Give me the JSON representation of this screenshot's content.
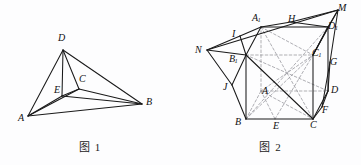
{
  "document": {
    "kind": "geometry-figure-pair",
    "background_color": "#fdfdfe",
    "ink_color": "#1a1a1a",
    "dashed_color": "#8d8d93"
  },
  "figure_1": {
    "caption": "图 1",
    "shape": "tetrahedron",
    "vertices": [
      {
        "id": "A",
        "label": "A",
        "x": 28,
        "y": 116,
        "label_x": 18,
        "label_y": 113
      },
      {
        "id": "B",
        "label": "B",
        "x": 142,
        "y": 104,
        "label_x": 146,
        "label_y": 97
      },
      {
        "id": "C",
        "label": "C",
        "x": 79,
        "y": 89,
        "label_x": 79,
        "label_y": 74
      },
      {
        "id": "D",
        "label": "D",
        "x": 63,
        "y": 50,
        "label_x": 58,
        "label_y": 33
      },
      {
        "id": "E",
        "label": "E",
        "x": 62,
        "y": 96,
        "label_x": 54,
        "label_y": 85
      }
    ],
    "solid_edges": [
      [
        "A",
        "B"
      ],
      [
        "A",
        "D"
      ],
      [
        "A",
        "C"
      ],
      [
        "A",
        "E"
      ],
      [
        "D",
        "B"
      ],
      [
        "D",
        "E"
      ],
      [
        "D",
        "C"
      ],
      [
        "C",
        "B"
      ],
      [
        "C",
        "E"
      ],
      [
        "E",
        "B"
      ]
    ],
    "dashed_edges": []
  },
  "figure_2": {
    "caption": "图 2",
    "shape": "cube-with-attached-prisms",
    "vertices": [
      {
        "id": "A1",
        "label": "A",
        "sub": "1",
        "x": 261,
        "y": 27,
        "label_x": 252,
        "label_y": 13
      },
      {
        "id": "B1",
        "label": "B",
        "sub": "1",
        "x": 246,
        "y": 55,
        "label_x": 229,
        "label_y": 54
      },
      {
        "id": "C1",
        "label": "C",
        "sub": "1",
        "x": 313,
        "y": 55,
        "label_x": 312,
        "label_y": 48
      },
      {
        "id": "D1",
        "label": "D",
        "sub": "1",
        "x": 328,
        "y": 27,
        "label_x": 328,
        "label_y": 21
      },
      {
        "id": "B",
        "label": "B",
        "x": 246,
        "y": 119,
        "label_x": 235,
        "label_y": 117
      },
      {
        "id": "C",
        "label": "C",
        "x": 313,
        "y": 119,
        "label_x": 310,
        "label_y": 120
      },
      {
        "id": "D",
        "label": "D",
        "x": 328,
        "y": 91,
        "label_x": 331,
        "label_y": 85
      },
      {
        "id": "A",
        "label": "A",
        "x": 261,
        "y": 91,
        "label_x": 262,
        "label_y": 86
      },
      {
        "id": "M",
        "label": "M",
        "x": 338,
        "y": 10,
        "label_x": 338,
        "label_y": 3
      },
      {
        "id": "N",
        "label": "N",
        "x": 207,
        "y": 50,
        "label_x": 195,
        "label_y": 45
      },
      {
        "id": "H",
        "label": "H",
        "x": 291,
        "y": 22,
        "label_x": 288,
        "label_y": 14
      },
      {
        "id": "I",
        "label": "I",
        "x": 240,
        "y": 36,
        "label_x": 232,
        "label_y": 29
      },
      {
        "id": "J",
        "label": "J",
        "x": 232,
        "y": 85,
        "label_x": 223,
        "label_y": 82
      },
      {
        "id": "E",
        "label": "E",
        "x": 275,
        "y": 119,
        "label_x": 273,
        "label_y": 121
      },
      {
        "id": "F",
        "label": "F",
        "x": 322,
        "y": 107,
        "label_x": 322,
        "label_y": 105
      },
      {
        "id": "G",
        "label": "G",
        "x": 330,
        "y": 62,
        "label_x": 330,
        "label_y": 57
      }
    ],
    "solid_edges": [
      [
        "B1",
        "A1"
      ],
      [
        "A1",
        "D1"
      ],
      [
        "D1",
        "C1"
      ],
      [
        "B1",
        "B"
      ],
      [
        "B",
        "C"
      ],
      [
        "C",
        "C1"
      ],
      [
        "C1",
        "D1"
      ],
      [
        "C",
        "D"
      ],
      [
        "D",
        "D1"
      ],
      [
        "N",
        "B1"
      ],
      [
        "N",
        "I"
      ],
      [
        "N",
        "J"
      ],
      [
        "I",
        "A1"
      ],
      [
        "I",
        "B1"
      ],
      [
        "J",
        "B"
      ],
      [
        "J",
        "B1"
      ],
      [
        "M",
        "H"
      ],
      [
        "M",
        "D1"
      ],
      [
        "M",
        "C1"
      ],
      [
        "M",
        "G"
      ],
      [
        "H",
        "A1"
      ],
      [
        "H",
        "D1"
      ],
      [
        "G",
        "D"
      ],
      [
        "G",
        "F"
      ],
      [
        "F",
        "C"
      ],
      [
        "F",
        "D"
      ],
      [
        "B1",
        "C"
      ],
      [
        "N",
        "M"
      ]
    ],
    "dashed_edges": [
      [
        "B",
        "A"
      ],
      [
        "A",
        "D"
      ],
      [
        "A",
        "A1"
      ],
      [
        "B1",
        "D"
      ],
      [
        "A1",
        "C"
      ],
      [
        "B",
        "D1"
      ],
      [
        "B",
        "C1"
      ],
      [
        "A",
        "C"
      ],
      [
        "A",
        "C1"
      ],
      [
        "B1",
        "C1"
      ],
      [
        "A1",
        "C1"
      ],
      [
        "E",
        "C1"
      ],
      [
        "E",
        "A"
      ]
    ]
  }
}
